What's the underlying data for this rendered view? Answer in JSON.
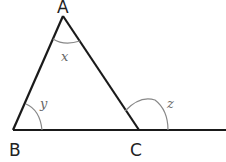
{
  "diagram": {
    "type": "triangle-exterior-angle",
    "vertices": [
      {
        "name": "A",
        "x": 63,
        "y": 16,
        "label_x": 57,
        "label_y": 13
      },
      {
        "name": "B",
        "x": 13,
        "y": 130,
        "label_x": 9,
        "label_y": 156
      },
      {
        "name": "C",
        "x": 139,
        "y": 130,
        "label_x": 130,
        "label_y": 156
      }
    ],
    "angles": [
      {
        "name": "x",
        "at": "A",
        "label_x": 62,
        "label_y": 60
      },
      {
        "name": "y",
        "at": "B",
        "label_x": 40,
        "label_y": 107
      },
      {
        "name": "z",
        "at": "C",
        "label_x": 167,
        "label_y": 107,
        "exterior": true
      }
    ],
    "line_color": "#1a1a1a",
    "arc_color": "#888888"
  }
}
